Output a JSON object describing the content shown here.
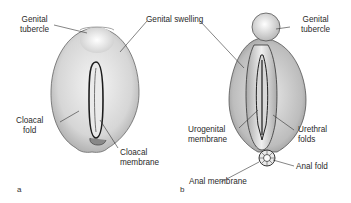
{
  "figure": {
    "panels": [
      {
        "id": "a",
        "letter": "a",
        "labels": {
          "genital_tubercle_line1": "Genital",
          "genital_tubercle_line2": "tubercle",
          "cloacal_fold_line1": "Cloacal",
          "cloacal_fold_line2": "fold",
          "cloacal_membrane_line1": "Cloacal",
          "cloacal_membrane_line2": "membrane"
        }
      },
      {
        "id": "b",
        "letter": "b",
        "labels": {
          "genital_swelling": "Genital swelling",
          "genital_tubercle_line1": "Genital",
          "genital_tubercle_line2": "tubercle",
          "urogenital_membrane_line1": "Urogenital",
          "urogenital_membrane_line2": "membrane",
          "urethral_folds_line1": "Urethral",
          "urethral_folds_line2": "folds",
          "anal_fold": "Anal fold",
          "anal_membrane": "Anal membrane"
        }
      }
    ],
    "colors": {
      "ink": "#222222",
      "shade": "#9a9a9a",
      "background": "#ffffff"
    }
  }
}
